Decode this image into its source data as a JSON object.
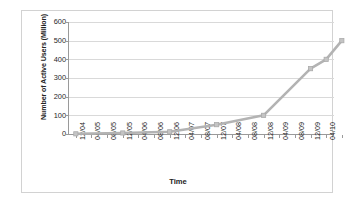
{
  "chart_data": {
    "type": "line",
    "title": "",
    "xlabel": "Time",
    "ylabel": "Number of Active Users (Million)",
    "ylim": [
      0,
      600
    ],
    "yticks": [
      0,
      100,
      200,
      300,
      400,
      500,
      600
    ],
    "ytick_labels": [
      "0",
      "100",
      "200",
      "300",
      "400",
      "500",
      "600"
    ],
    "grid": true,
    "legend": "none",
    "categories": [
      "12/04",
      "04/05",
      "08/05",
      "12/05",
      "04/06",
      "08/06",
      "12/06",
      "04/07",
      "08/07",
      "12/07",
      "04/08",
      "08/08",
      "12/08",
      "04/09",
      "08/09",
      "12/09",
      "04/10",
      "08/10"
    ],
    "xtick_labels": [
      "12/04",
      "04/05",
      "08/05",
      "12/05",
      "04/06",
      "08/06",
      "12/06",
      "04/07",
      "08/07",
      "12/07",
      "04/08",
      "08/08",
      "12/08",
      "04/09",
      "08/09",
      "12/09",
      "04/10"
    ],
    "series": [
      {
        "name": "Active Users",
        "color": "#b3b3b3",
        "marker": "square",
        "points": [
          {
            "x": "12/04",
            "x_index": 0,
            "y": 1
          },
          {
            "x": "12/05",
            "x_index": 3,
            "y": 5.5
          },
          {
            "x": "12/06",
            "x_index": 6,
            "y": 12
          },
          {
            "x": "12/07",
            "x_index": 9,
            "y": 50
          },
          {
            "x": "12/08",
            "x_index": 12,
            "y": 100
          },
          {
            "x": "12/09",
            "x_index": 15,
            "y": 350
          },
          {
            "x": "04/10",
            "x_index": 16,
            "y": 400
          },
          {
            "x": "08/10",
            "x_index": 17,
            "y": 500
          }
        ]
      }
    ],
    "colors": {
      "line": "#b3b3b3",
      "gridline": "#d9d9d9",
      "axis": "#9a9a9a",
      "frame_border": "#d2d2d2",
      "text": "#1f1f1f",
      "background": "#ffffff"
    }
  }
}
